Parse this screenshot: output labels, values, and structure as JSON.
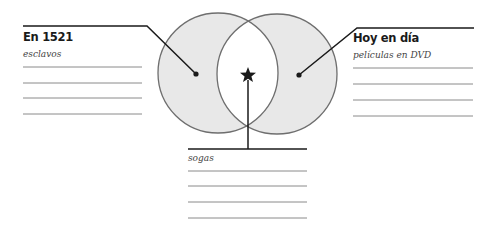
{
  "diagram": {
    "type": "venn",
    "left": {
      "title": "En 1521",
      "example": "esclavos",
      "blank_lines": 4
    },
    "right": {
      "title": "Hoy en día",
      "example": "películas en DVD",
      "blank_lines": 4
    },
    "overlap": {
      "example": "sogas",
      "blank_lines": 4,
      "marker": "star-icon"
    },
    "colors": {
      "circle_fill": "#e8e8e8",
      "circle_stroke": "#6e6e6e",
      "line": "#1a1a1a",
      "write_line": "#8a8a8a",
      "overlap_fill": "#ffffff"
    }
  }
}
